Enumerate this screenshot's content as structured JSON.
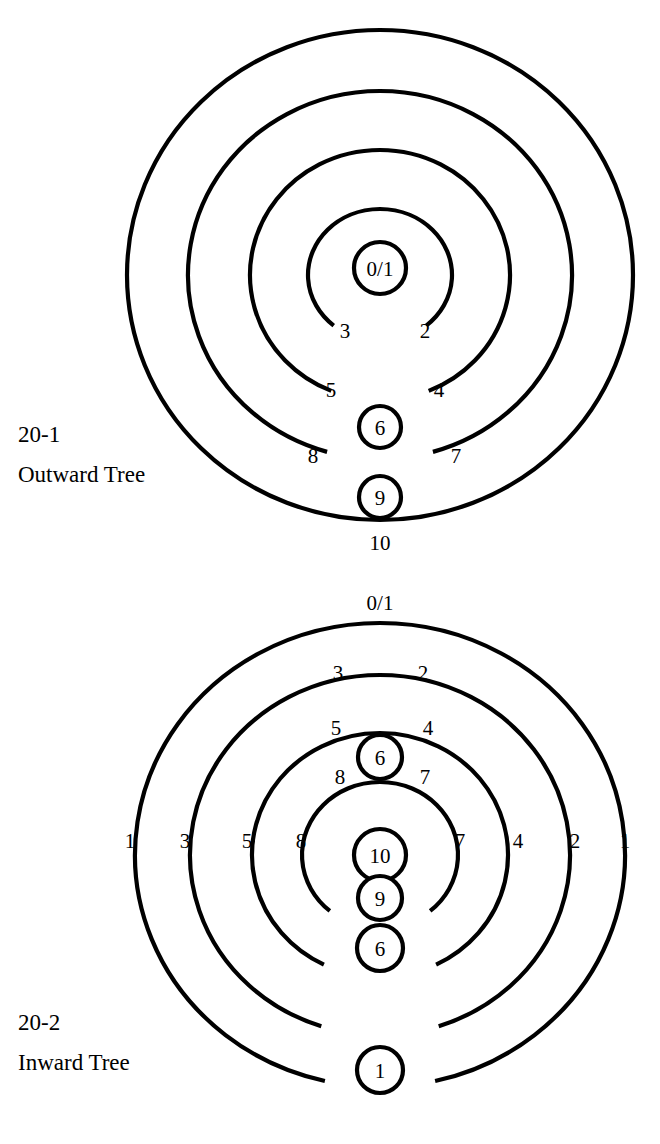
{
  "page": {
    "background": "#ffffff",
    "ink": "#000000",
    "width": 660,
    "height": 1144
  },
  "figures": [
    {
      "id": "outward-tree",
      "number": "20-1",
      "title": "Outward Tree",
      "caption_x": 18,
      "caption_number_y": 442,
      "caption_title_y": 482,
      "center": {
        "x": 380,
        "y": 275
      },
      "rings": [
        {
          "name": "ring-1",
          "rx": 253,
          "ry": 245,
          "stroke": 4.2,
          "gap_deg": 0
        },
        {
          "name": "ring-2",
          "rx": 192,
          "ry": 184,
          "stroke": 4.2,
          "gap_deg": 16
        },
        {
          "name": "ring-3",
          "rx": 130,
          "ry": 125,
          "stroke": 4.2,
          "gap_deg": 22
        },
        {
          "name": "ring-4",
          "rx": 72,
          "ry": 66,
          "stroke": 4.2,
          "gap_deg": 40
        }
      ],
      "center_node": {
        "label": "0/1",
        "cx": 380,
        "cy": 268,
        "r": 26
      },
      "arc_labels": [
        {
          "text": "3",
          "x": 345,
          "y": 338
        },
        {
          "text": "2",
          "x": 425,
          "y": 338
        },
        {
          "text": "5",
          "x": 331,
          "y": 397
        },
        {
          "text": "4",
          "x": 439,
          "y": 397
        },
        {
          "text": "8",
          "x": 313,
          "y": 463
        },
        {
          "text": "7",
          "x": 456,
          "y": 463
        },
        {
          "text": "10",
          "x": 380,
          "y": 550
        }
      ],
      "nodes": [
        {
          "label": "6",
          "cx": 380,
          "cy": 427,
          "r": 21
        },
        {
          "label": "9",
          "cx": 380,
          "cy": 497,
          "r": 21
        }
      ]
    },
    {
      "id": "inward-tree",
      "number": "20-2",
      "title": "Inward Tree",
      "caption_x": 18,
      "caption_number_y": 1030,
      "caption_title_y": 1070,
      "center": {
        "x": 380,
        "y": 855
      },
      "rings": [
        {
          "name": "ring-1",
          "rx": 245,
          "ry": 232,
          "stroke": 4.2,
          "gap_deg": 13
        },
        {
          "name": "ring-2",
          "rx": 190,
          "ry": 180,
          "stroke": 4.2,
          "gap_deg": 18
        },
        {
          "name": "ring-3",
          "rx": 128,
          "ry": 122,
          "stroke": 4.2,
          "gap_deg": 26
        },
        {
          "name": "ring-4",
          "rx": 78,
          "ry": 73,
          "stroke": 4.2,
          "gap_deg": 40
        }
      ],
      "center_node": {
        "label": "10",
        "cx": 380,
        "cy": 855,
        "r": 26
      },
      "arc_labels": [
        {
          "text": "0/1",
          "x": 380,
          "y": 610
        },
        {
          "text": "3",
          "x": 338,
          "y": 680
        },
        {
          "text": "2",
          "x": 423,
          "y": 680
        },
        {
          "text": "5",
          "x": 336,
          "y": 735
        },
        {
          "text": "4",
          "x": 428,
          "y": 735
        },
        {
          "text": "8",
          "x": 340,
          "y": 784
        },
        {
          "text": "7",
          "x": 425,
          "y": 784
        },
        {
          "text": "1",
          "x": 130,
          "y": 848
        },
        {
          "text": "3",
          "x": 185,
          "y": 848
        },
        {
          "text": "5",
          "x": 247,
          "y": 848
        },
        {
          "text": "8",
          "x": 301,
          "y": 848
        },
        {
          "text": "7",
          "x": 460,
          "y": 848
        },
        {
          "text": "4",
          "x": 518,
          "y": 848
        },
        {
          "text": "2",
          "x": 575,
          "y": 848
        },
        {
          "text": "1",
          "x": 625,
          "y": 848
        }
      ],
      "nodes": [
        {
          "label": "6",
          "cx": 380,
          "cy": 757,
          "r": 22
        },
        {
          "label": "9",
          "cx": 380,
          "cy": 898,
          "r": 22
        },
        {
          "label": "6",
          "cx": 380,
          "cy": 948,
          "r": 23
        },
        {
          "label": "1",
          "cx": 380,
          "cy": 1070,
          "r": 23
        }
      ]
    }
  ]
}
